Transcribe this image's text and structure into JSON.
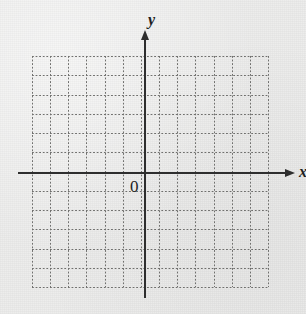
{
  "figure": {
    "kind": "cartesian-grid",
    "background_color": "#ececeb",
    "origin_label": "0",
    "x_axis_label": "x",
    "y_axis_label": "y",
    "axis_color": "#2e2e2e",
    "grid_color": "#6f6f6d",
    "grid_style": "dotted"
  },
  "chart_data": {
    "type": "scatter",
    "title": "",
    "subtitle": "",
    "xlabel": "x",
    "ylabel": "y",
    "series": [
      {
        "name": "data",
        "x": [],
        "y": []
      }
    ],
    "x": [],
    "values": [],
    "categories": [],
    "annotations": [
      {
        "text": "0",
        "role": "origin-label",
        "x": 0,
        "y": 0
      },
      {
        "text": "x",
        "role": "x-axis-label"
      },
      {
        "text": "y",
        "role": "y-axis-label"
      }
    ],
    "xlim": [
      -6,
      7
    ],
    "ylim": [
      -6,
      6
    ],
    "xticks": [
      -6,
      -5,
      -4,
      -3,
      -2,
      -1,
      0,
      1,
      2,
      3,
      4,
      5,
      6,
      7
    ],
    "yticks": [
      -6,
      -5,
      -4,
      -3,
      -2,
      -1,
      0,
      1,
      2,
      3,
      4,
      5,
      6
    ],
    "xtick_labels": [],
    "ytick_labels": [],
    "grid": true,
    "grid_linestyle": "dotted",
    "legend": false,
    "legend_position": "none",
    "axis_arrows": true
  },
  "geometry": {
    "grid_left": 32,
    "grid_top": 56,
    "grid_right": 268,
    "grid_bottom": 287,
    "v_line_count": 14,
    "h_line_count": 13,
    "v_spacing": 18.15,
    "h_spacing": 19.25,
    "x_axis_y": 172,
    "y_axis_x": 144,
    "x_axis_start": 18,
    "x_axis_end": 285,
    "y_axis_top": 40,
    "y_axis_bottom": 298
  }
}
